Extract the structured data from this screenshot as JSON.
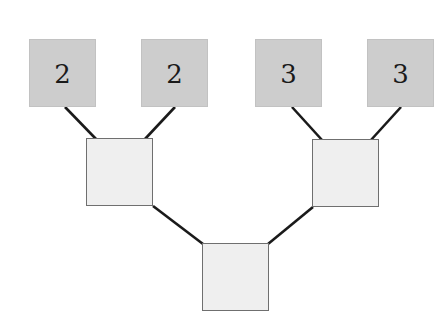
{
  "diagram": {
    "type": "binary-tree",
    "colors": {
      "leaf_fill": "#cdcdcd",
      "inner_fill": "#efefef",
      "inner_border": "#6f6f6f",
      "edge": "#1a1a1a"
    },
    "leaves": [
      {
        "id": "leaf-1",
        "label": "2"
      },
      {
        "id": "leaf-2",
        "label": "2"
      },
      {
        "id": "leaf-3",
        "label": "3"
      },
      {
        "id": "leaf-4",
        "label": "3"
      }
    ],
    "inner_nodes": [
      {
        "id": "inner-left",
        "label": ""
      },
      {
        "id": "inner-right",
        "label": ""
      }
    ],
    "root": {
      "id": "root",
      "label": ""
    },
    "edges": [
      [
        "leaf-1",
        "inner-left"
      ],
      [
        "leaf-2",
        "inner-left"
      ],
      [
        "leaf-3",
        "inner-right"
      ],
      [
        "leaf-4",
        "inner-right"
      ],
      [
        "inner-left",
        "root"
      ],
      [
        "inner-right",
        "root"
      ]
    ]
  }
}
